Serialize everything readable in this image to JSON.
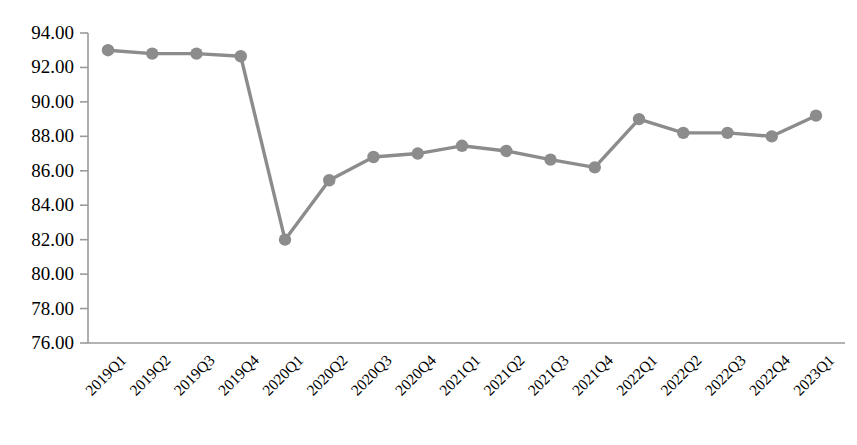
{
  "chart_data": {
    "type": "line",
    "title": "",
    "subtitle": "",
    "xlabel": "",
    "ylabel": "",
    "categories": [
      "2019Q1",
      "2019Q2",
      "2019Q3",
      "2019Q4",
      "2020Q1",
      "2020Q2",
      "2020Q3",
      "2020Q4",
      "2021Q1",
      "2021Q2",
      "2021Q3",
      "2021Q4",
      "2022Q1",
      "2022Q2",
      "2022Q3",
      "2022Q4",
      "2023Q1"
    ],
    "values": [
      93.0,
      92.8,
      92.8,
      92.65,
      82.0,
      85.45,
      86.8,
      87.0,
      87.45,
      87.15,
      86.65,
      86.2,
      89.0,
      88.2,
      88.2,
      88.0,
      89.2
    ],
    "series": [
      {
        "name": "",
        "values": [
          93.0,
          92.8,
          92.8,
          92.65,
          82.0,
          85.45,
          86.8,
          87.0,
          87.45,
          87.15,
          86.65,
          86.2,
          89.0,
          88.2,
          88.2,
          88.0,
          89.2
        ]
      }
    ],
    "ylim": [
      76.0,
      94.0
    ],
    "ytick_values": [
      94.0,
      92.0,
      90.0,
      88.0,
      86.0,
      84.0,
      82.0,
      80.0,
      78.0,
      76.0
    ],
    "ytick_labels": [
      "94.00",
      "92.00",
      "90.00",
      "88.00",
      "86.00",
      "84.00",
      "82.00",
      "80.00",
      "78.00",
      "76.00"
    ],
    "ytick_step": 2.0,
    "grid": false,
    "legend": false,
    "legend_position": "none",
    "marker": "circle",
    "line_color": "#8C8C8C",
    "marker_color": "#8C8C8C",
    "axis_color": "#9A9A9A",
    "background_color": "#FFFFFF",
    "annotations": []
  },
  "axes": {
    "x_label_rotation": -45
  }
}
